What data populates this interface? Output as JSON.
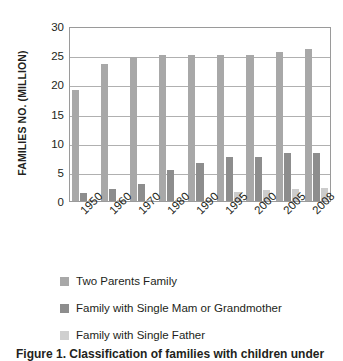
{
  "chart_data": {
    "type": "bar",
    "title": "",
    "xlabel": "",
    "ylabel": "FAMILIES NO. (MILLION)",
    "ylim": [
      0,
      30
    ],
    "yticks": [
      30,
      25,
      20,
      15,
      10,
      5,
      0
    ],
    "grid": true,
    "legend_position": "bottom-left",
    "categories": [
      "1950",
      "1960",
      "1970",
      "1980",
      "1990",
      "1995",
      "2000",
      "2005",
      "2008"
    ],
    "series": [
      {
        "name": "Two Parents Family",
        "color": "#a8a8a8",
        "values": [
          19.0,
          23.5,
          24.7,
          25.0,
          25.1,
          25.1,
          25.1,
          25.5,
          26.0
        ]
      },
      {
        "name": "Family with Single Mam or Grandmother",
        "color": "#8d8d8d",
        "values": [
          1.4,
          2.1,
          3.0,
          5.4,
          6.5,
          7.5,
          7.6,
          8.2,
          8.3
        ]
      },
      {
        "name": "Family with Single Father",
        "color": "#cccccc",
        "values": [
          0.15,
          0.15,
          0.15,
          0.2,
          0.2,
          1.6,
          1.9,
          2.1,
          2.3
        ]
      }
    ]
  },
  "legend": {
    "items": [
      {
        "label": "Two Parents Family"
      },
      {
        "label": "Family with Single Mam or Grandmother"
      },
      {
        "label": "Family with Single Father"
      }
    ]
  },
  "caption": {
    "text": "Figure 1. Classification of families with children under"
  }
}
